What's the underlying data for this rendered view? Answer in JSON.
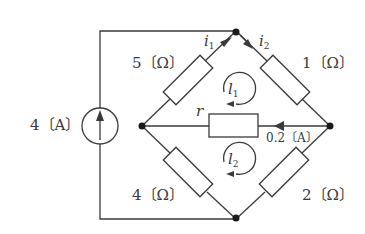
{
  "diagram": {
    "type": "circuit",
    "colors": {
      "line": "#3a3a3a",
      "background": "#ffffff"
    },
    "current_source": {
      "label": "4〔A〕",
      "direction": "up",
      "icon": "current-source-arrow-up"
    },
    "resistors": {
      "top_left": {
        "label": "5〔Ω〕"
      },
      "top_right": {
        "label": "1〔Ω〕"
      },
      "bottom_left": {
        "label": "4〔Ω〕"
      },
      "bottom_right": {
        "label": "2〔Ω〕"
      },
      "middle": {
        "label": "r"
      }
    },
    "branch_currents": {
      "i1": {
        "symbol": "i",
        "subscript": "1"
      },
      "i2": {
        "symbol": "i",
        "subscript": "2"
      },
      "middle": {
        "label": "0.2〔A〕",
        "direction": "right-to-left"
      }
    },
    "loops": {
      "l1": {
        "symbol": "l",
        "subscript": "1",
        "direction": "clockwise"
      },
      "l2": {
        "symbol": "l",
        "subscript": "2",
        "direction": "clockwise"
      }
    }
  }
}
